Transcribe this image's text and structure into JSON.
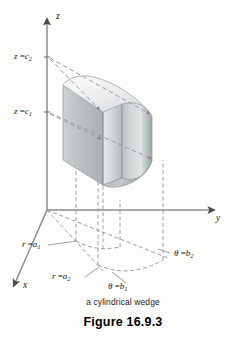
{
  "figure": {
    "caption": "a cylindrical wedge",
    "number": "Figure 16.9.3",
    "axes": {
      "x_label": "x",
      "y_label": "y",
      "z_label": "z"
    },
    "labels": {
      "z_upper": {
        "var": "z",
        "eq": "=",
        "value": "c",
        "sub": "2",
        "full": "z = c2"
      },
      "z_lower": {
        "var": "z",
        "eq": "=",
        "value": "c",
        "sub": "1",
        "full": "z = c1"
      },
      "r_inner": {
        "var": "r",
        "eq": "=",
        "value": "a",
        "sub": "1",
        "full": "r = a1"
      },
      "r_outer": {
        "var": "r",
        "eq": "=",
        "value": "a",
        "sub": "2",
        "full": "r = a2"
      },
      "theta_first": {
        "var": "θ",
        "eq": "=",
        "value": "b",
        "sub": "1",
        "full": "θ = b1"
      },
      "theta_second": {
        "var": "θ",
        "eq": "=",
        "value": "b",
        "sub": "2",
        "full": "θ = b2"
      }
    },
    "colors": {
      "axis": "#8c8c8c",
      "dashed": "#9c8fa2",
      "solid_light": "#e8eaea",
      "solid_mid": "#c6cacb",
      "solid_dark": "#9aa0a2",
      "solid_outline": "#8d9395",
      "text": "#1c1c1c",
      "background": "#fdfdfc"
    }
  }
}
